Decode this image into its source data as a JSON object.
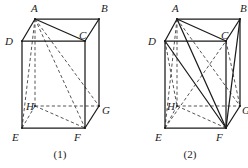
{
  "document": {
    "type": "geometry-figure-pair",
    "description": "Two oblique-projection rectangular prisms with labelled vertices and internal diagonals",
    "background_color": "#ffffff",
    "ink_color": "#1b1b1b",
    "dashed_color": "#555555"
  },
  "figures": [
    {
      "id": "figure-1",
      "caption": "(1)",
      "caption_pos": {
        "x": 60,
        "y": 158
      },
      "vertices": {
        "A": {
          "x": 35,
          "y": 19,
          "label": "A",
          "label_x": 31,
          "label_y": 12
        },
        "B": {
          "x": 99,
          "y": 19,
          "label": "B",
          "label_x": 101,
          "label_y": 12
        },
        "C": {
          "x": 85,
          "y": 41,
          "label": "C",
          "label_x": 79,
          "label_y": 39
        },
        "D": {
          "x": 22,
          "y": 41,
          "label": "D",
          "label_x": 5,
          "label_y": 45
        },
        "E": {
          "x": 22,
          "y": 128,
          "label": "E",
          "label_x": 12,
          "label_y": 141
        },
        "F": {
          "x": 85,
          "y": 128,
          "label": "F",
          "label_x": 74,
          "label_y": 141
        },
        "G": {
          "x": 99,
          "y": 106,
          "label": "G",
          "label_x": 102,
          "label_y": 114
        },
        "H": {
          "x": 35,
          "y": 106,
          "label": "H",
          "label_x": 26,
          "label_y": 110
        }
      },
      "solid_edges": [
        [
          "A",
          "B"
        ],
        [
          "A",
          "D"
        ],
        [
          "B",
          "G"
        ],
        [
          "C",
          "B"
        ],
        [
          "D",
          "C"
        ],
        [
          "D",
          "E"
        ],
        [
          "E",
          "F"
        ],
        [
          "F",
          "C"
        ],
        [
          "F",
          "G"
        ],
        [
          "A",
          "C"
        ]
      ],
      "dashed_edges": [
        [
          "E",
          "H"
        ],
        [
          "H",
          "G"
        ],
        [
          "H",
          "F"
        ],
        [
          "A",
          "E"
        ],
        [
          "A",
          "H"
        ],
        [
          "A",
          "F"
        ],
        [
          "A",
          "G"
        ]
      ]
    },
    {
      "id": "figure-2",
      "caption": "(2)",
      "caption_pos": {
        "x": 190,
        "y": 158
      },
      "vertices": {
        "A": {
          "x": 177,
          "y": 19,
          "label": "A",
          "label_x": 172,
          "label_y": 12
        },
        "B": {
          "x": 240,
          "y": 19,
          "label": "B",
          "label_x": 240,
          "label_y": 12
        },
        "C": {
          "x": 226,
          "y": 41,
          "label": "C",
          "label_x": 221,
          "label_y": 39
        },
        "D": {
          "x": 165,
          "y": 41,
          "label": "D",
          "label_x": 148,
          "label_y": 45
        },
        "E": {
          "x": 165,
          "y": 128,
          "label": "E",
          "label_x": 155,
          "label_y": 141
        },
        "F": {
          "x": 226,
          "y": 128,
          "label": "F",
          "label_x": 216,
          "label_y": 141
        },
        "G": {
          "x": 240,
          "y": 106,
          "label": "G",
          "label_x": 242,
          "label_y": 114
        },
        "H": {
          "x": 177,
          "y": 106,
          "label": "H",
          "label_x": 167,
          "label_y": 110
        }
      },
      "solid_edges": [
        [
          "A",
          "B"
        ],
        [
          "A",
          "D"
        ],
        [
          "B",
          "G"
        ],
        [
          "C",
          "B"
        ],
        [
          "D",
          "C"
        ],
        [
          "D",
          "E"
        ],
        [
          "E",
          "F"
        ],
        [
          "F",
          "C"
        ],
        [
          "F",
          "G"
        ],
        [
          "A",
          "C"
        ],
        [
          "D",
          "F"
        ],
        [
          "A",
          "F"
        ],
        [
          "B",
          "F"
        ]
      ],
      "dashed_edges": [
        [
          "E",
          "H"
        ],
        [
          "H",
          "G"
        ],
        [
          "H",
          "F"
        ],
        [
          "A",
          "E"
        ],
        [
          "A",
          "H"
        ],
        [
          "A",
          "G"
        ],
        [
          "E",
          "C"
        ],
        [
          "C",
          "G"
        ],
        [
          "D",
          "H"
        ]
      ]
    }
  ]
}
